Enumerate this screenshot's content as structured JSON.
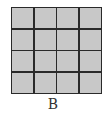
{
  "figure": {
    "label": "B",
    "grid": {
      "rows": 4,
      "cols": 4,
      "cell_color": "#c8c8c8",
      "line_color": "#2a2a2a"
    }
  }
}
